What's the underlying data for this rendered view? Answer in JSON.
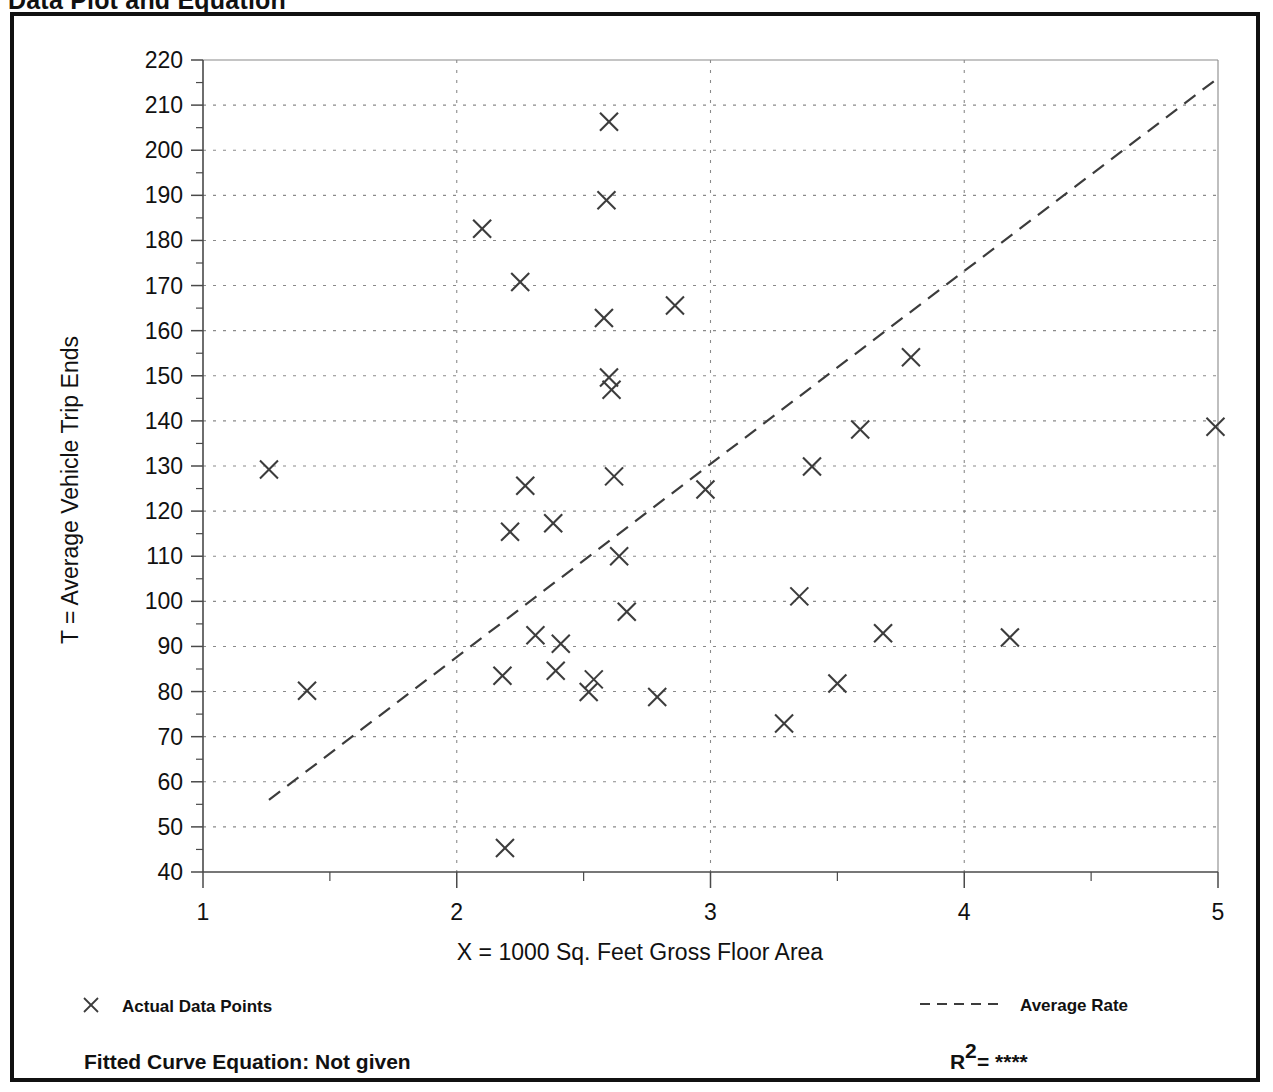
{
  "page": {
    "title": "Data Plot and Equation"
  },
  "chart_data": {
    "type": "scatter",
    "title": "Data Plot and Equation",
    "xlabel": "X = 1000 Sq. Feet Gross Floor Area",
    "ylabel": "T = Average Vehicle Trip Ends",
    "xlim": [
      1,
      5
    ],
    "ylim": [
      40,
      220
    ],
    "xticks": [
      1,
      2,
      3,
      4,
      5
    ],
    "xtick_labels": [
      "1",
      "2",
      "3",
      "4",
      "5"
    ],
    "yticks": [
      40,
      50,
      60,
      70,
      80,
      90,
      100,
      110,
      120,
      130,
      140,
      150,
      160,
      170,
      180,
      190,
      200,
      210,
      220
    ],
    "ytick_labels": [
      "40",
      "50",
      "60",
      "70",
      "80",
      "90",
      "100",
      "110",
      "120",
      "130",
      "140",
      "150",
      "160",
      "170",
      "180",
      "190",
      "200",
      "210",
      "220"
    ],
    "grid": true,
    "grid_style": "dotted",
    "x_minor_ticks": [
      1.5,
      2.5,
      3.5,
      4.5
    ],
    "series": [
      {
        "name": "Actual Data Points",
        "type": "scatter",
        "marker": "x",
        "color": "#3c3c3c",
        "points": [
          [
            1.26,
            129.2
          ],
          [
            1.41,
            80.2
          ],
          [
            2.1,
            182.6
          ],
          [
            2.18,
            83.5
          ],
          [
            2.19,
            45.3
          ],
          [
            2.21,
            115.4
          ],
          [
            2.25,
            170.8
          ],
          [
            2.27,
            125.6
          ],
          [
            2.31,
            92.5
          ],
          [
            2.38,
            117.3
          ],
          [
            2.39,
            84.6
          ],
          [
            2.41,
            90.6
          ],
          [
            2.52,
            79.9
          ],
          [
            2.54,
            82.7
          ],
          [
            2.58,
            162.8
          ],
          [
            2.59,
            188.9
          ],
          [
            2.6,
            206.3
          ],
          [
            2.6,
            149.6
          ],
          [
            2.61,
            146.9
          ],
          [
            2.62,
            127.7
          ],
          [
            2.64,
            110.0
          ],
          [
            2.67,
            97.7
          ],
          [
            2.79,
            78.8
          ],
          [
            2.86,
            165.6
          ],
          [
            2.98,
            124.8
          ],
          [
            3.29,
            72.9
          ],
          [
            3.35,
            101.1
          ],
          [
            3.4,
            129.9
          ],
          [
            3.5,
            81.8
          ],
          [
            3.59,
            138.1
          ],
          [
            3.68,
            92.9
          ],
          [
            3.79,
            154.1
          ],
          [
            4.18,
            92.0
          ],
          [
            4.99,
            138.7
          ]
        ]
      },
      {
        "name": "Average Rate",
        "type": "line",
        "style": "dashed",
        "color": "#3c3c3c",
        "x": [
          1.26,
          5.0
        ],
        "y": [
          56.0,
          216.0
        ]
      }
    ],
    "legend": [
      {
        "label": "Actual Data Points",
        "marker": "x",
        "position": "bottom-left"
      },
      {
        "label": "Average Rate",
        "marker": "dashed-line",
        "position": "bottom-right"
      }
    ],
    "annotations": {
      "fitted_curve_equation": "Fitted Curve Equation:  Not given",
      "r_squared_prefix": "R",
      "r_squared_exponent": "2",
      "r_squared_value": "= ****"
    }
  },
  "legend": {
    "actual_data_points": "Actual Data Points",
    "average_rate": "Average Rate"
  },
  "footer": {
    "fitted_curve_equation": "Fitted Curve Equation:  Not given",
    "r_label": "R",
    "r_exponent": "2",
    "r_value": "= ****"
  },
  "colors": {
    "ink": "#3c3c3c",
    "frame": "#111111",
    "grid": "#8a8a8a"
  }
}
